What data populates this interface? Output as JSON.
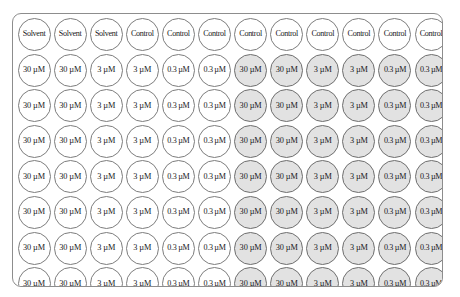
{
  "diagram": {
    "plate": {
      "rows": 8,
      "columns": 12,
      "shaded_fill": "#e2e2e2",
      "unshaded_fill": "#ffffff",
      "border_color": "#8d8d8d"
    },
    "legend_note": "Columns 1-6 unshaded, columns 7-12 shaded",
    "wells": [
      [
        {
          "label": "Solvent",
          "shaded": false
        },
        {
          "label": "Solvent",
          "shaded": false
        },
        {
          "label": "Solvent",
          "shaded": false
        },
        {
          "label": "Control",
          "shaded": false
        },
        {
          "label": "Control",
          "shaded": false
        },
        {
          "label": "Control",
          "shaded": false
        },
        {
          "label": "Control",
          "shaded": false
        },
        {
          "label": "Control",
          "shaded": false
        },
        {
          "label": "Control",
          "shaded": false
        },
        {
          "label": "Control",
          "shaded": false
        },
        {
          "label": "Control",
          "shaded": false
        },
        {
          "label": "Control",
          "shaded": false
        }
      ],
      [
        {
          "label": "30 µM",
          "shaded": false
        },
        {
          "label": "30 µM",
          "shaded": false
        },
        {
          "label": "3 µM",
          "shaded": false
        },
        {
          "label": "3 µM",
          "shaded": false
        },
        {
          "label": "0.3 µM",
          "shaded": false
        },
        {
          "label": "0.3 µM",
          "shaded": false
        },
        {
          "label": "30 µM",
          "shaded": true
        },
        {
          "label": "30 µM",
          "shaded": true
        },
        {
          "label": "3 µM",
          "shaded": true
        },
        {
          "label": "3 µM",
          "shaded": true
        },
        {
          "label": "0.3 µM",
          "shaded": true
        },
        {
          "label": "0.3 µM",
          "shaded": true
        }
      ],
      [
        {
          "label": "30 µM",
          "shaded": false
        },
        {
          "label": "30 µM",
          "shaded": false
        },
        {
          "label": "3 µM",
          "shaded": false
        },
        {
          "label": "3 µM",
          "shaded": false
        },
        {
          "label": "0.3 µM",
          "shaded": false
        },
        {
          "label": "0.3 µM",
          "shaded": false
        },
        {
          "label": "30 µM",
          "shaded": true
        },
        {
          "label": "30 µM",
          "shaded": true
        },
        {
          "label": "3 µM",
          "shaded": true
        },
        {
          "label": "3 µM",
          "shaded": true
        },
        {
          "label": "0.3 µM",
          "shaded": true
        },
        {
          "label": "0.3 µM",
          "shaded": true
        }
      ],
      [
        {
          "label": "30 µM",
          "shaded": false
        },
        {
          "label": "30 µM",
          "shaded": false
        },
        {
          "label": "3 µM",
          "shaded": false
        },
        {
          "label": "3 µM",
          "shaded": false
        },
        {
          "label": "0.3 µM",
          "shaded": false
        },
        {
          "label": "0.3 µM",
          "shaded": false
        },
        {
          "label": "30 µM",
          "shaded": true
        },
        {
          "label": "30 µM",
          "shaded": true
        },
        {
          "label": "3 µM",
          "shaded": true
        },
        {
          "label": "3 µM",
          "shaded": true
        },
        {
          "label": "0.3 µM",
          "shaded": true
        },
        {
          "label": "0.3 µM",
          "shaded": true
        }
      ],
      [
        {
          "label": "30 µM",
          "shaded": false
        },
        {
          "label": "30 µM",
          "shaded": false
        },
        {
          "label": "3 µM",
          "shaded": false
        },
        {
          "label": "3 µM",
          "shaded": false
        },
        {
          "label": "0.3 µM",
          "shaded": false
        },
        {
          "label": "0.3 µM",
          "shaded": false
        },
        {
          "label": "30 µM",
          "shaded": true
        },
        {
          "label": "30 µM",
          "shaded": true
        },
        {
          "label": "3 µM",
          "shaded": true
        },
        {
          "label": "3 µM",
          "shaded": true
        },
        {
          "label": "0.3 µM",
          "shaded": true
        },
        {
          "label": "0.3 µM",
          "shaded": true
        }
      ],
      [
        {
          "label": "30 µM",
          "shaded": false
        },
        {
          "label": "30 µM",
          "shaded": false
        },
        {
          "label": "3 µM",
          "shaded": false
        },
        {
          "label": "3 µM",
          "shaded": false
        },
        {
          "label": "0.3 µM",
          "shaded": false
        },
        {
          "label": "0.3 µM",
          "shaded": false
        },
        {
          "label": "30 µM",
          "shaded": true
        },
        {
          "label": "30 µM",
          "shaded": true
        },
        {
          "label": "3 µM",
          "shaded": true
        },
        {
          "label": "3 µM",
          "shaded": true
        },
        {
          "label": "0.3 µM",
          "shaded": true
        },
        {
          "label": "0.3 µM",
          "shaded": true
        }
      ],
      [
        {
          "label": "30 µM",
          "shaded": false
        },
        {
          "label": "30 µM",
          "shaded": false
        },
        {
          "label": "3 µM",
          "shaded": false
        },
        {
          "label": "3 µM",
          "shaded": false
        },
        {
          "label": "0.3 µM",
          "shaded": false
        },
        {
          "label": "0.3 µM",
          "shaded": false
        },
        {
          "label": "30 µM",
          "shaded": true
        },
        {
          "label": "30 µM",
          "shaded": true
        },
        {
          "label": "3 µM",
          "shaded": true
        },
        {
          "label": "3 µM",
          "shaded": true
        },
        {
          "label": "0.3 µM",
          "shaded": true
        },
        {
          "label": "0.3 µM",
          "shaded": true
        }
      ],
      [
        {
          "label": "30 µM",
          "shaded": false
        },
        {
          "label": "30 µM",
          "shaded": false
        },
        {
          "label": "3 µM",
          "shaded": false
        },
        {
          "label": "3 µM",
          "shaded": false
        },
        {
          "label": "0.3 µM",
          "shaded": false
        },
        {
          "label": "0.3 µM",
          "shaded": false
        },
        {
          "label": "30 µM",
          "shaded": true
        },
        {
          "label": "30 µM",
          "shaded": true
        },
        {
          "label": "3 µM",
          "shaded": true
        },
        {
          "label": "3 µM",
          "shaded": true
        },
        {
          "label": "0.3 µM",
          "shaded": true
        },
        {
          "label": "0.3 µM",
          "shaded": true
        }
      ]
    ]
  }
}
